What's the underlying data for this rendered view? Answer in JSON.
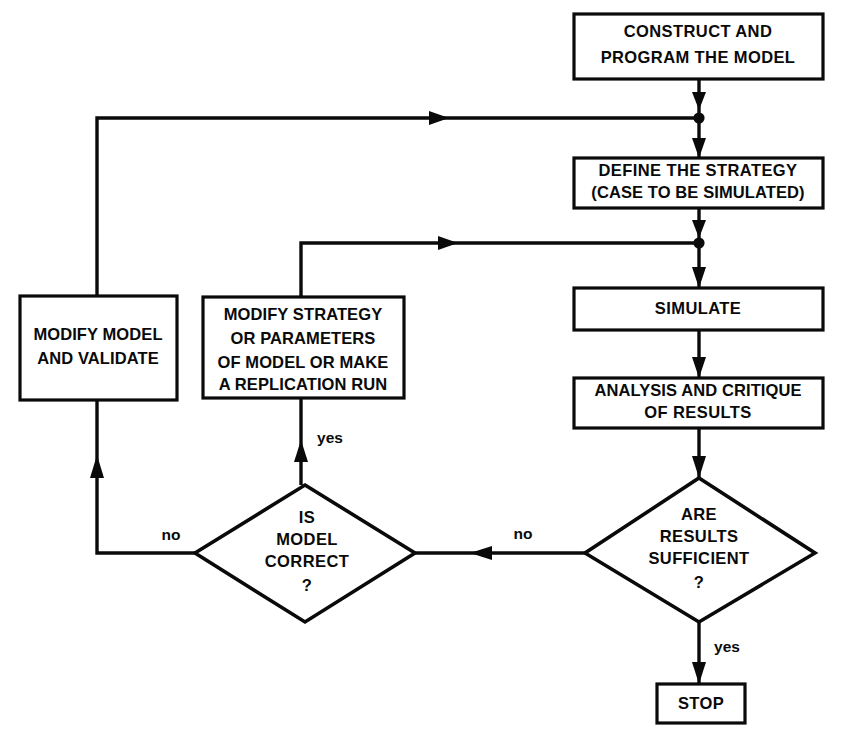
{
  "diagram": {
    "ink_color": "#0a0a0a",
    "background_color": "#ffffff",
    "nodes": {
      "construct": {
        "shape": "process-box",
        "line1": "CONSTRUCT AND",
        "line2": "PROGRAM THE MODEL"
      },
      "define_strategy": {
        "shape": "process-box",
        "line1": "DEFINE THE STRATEGY",
        "line2": "(CASE TO BE SIMULATED)"
      },
      "simulate": {
        "shape": "process-box",
        "line1": "SIMULATE"
      },
      "analysis": {
        "shape": "process-box",
        "line1": "ANALYSIS AND CRITIQUE",
        "line2": "OF RESULTS"
      },
      "results_sufficient": {
        "shape": "decision-diamond",
        "line1": "ARE",
        "line2": "RESULTS",
        "line3": "SUFFICIENT",
        "line4": "?"
      },
      "model_correct": {
        "shape": "decision-diamond",
        "line1": "IS",
        "line2": "MODEL",
        "line3": "CORRECT",
        "line4": "?"
      },
      "modify_strategy": {
        "shape": "process-box",
        "line1": "MODIFY STRATEGY",
        "line2": "OR PARAMETERS",
        "line3": "OF MODEL OR MAKE",
        "line4": "A REPLICATION RUN"
      },
      "modify_model": {
        "shape": "process-box",
        "line1": "MODIFY MODEL",
        "line2": "AND VALIDATE"
      },
      "stop": {
        "shape": "terminator-box",
        "line1": "STOP"
      }
    },
    "edge_labels": {
      "results_to_stop": "yes",
      "results_to_model_correct": "no",
      "model_correct_to_modify_strategy": "yes",
      "model_correct_to_modify_model": "no"
    }
  }
}
